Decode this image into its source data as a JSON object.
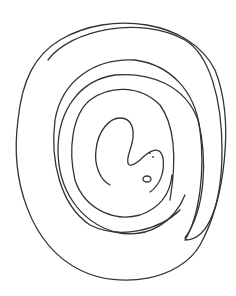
{
  "image": {
    "subject": "coiled snake spiral line drawing",
    "background": "#ffffff",
    "stroke_color": "#333333"
  },
  "paths": {
    "outer": "M 60 40 C 110 10, 190 20, 215 70 C 235 120, 225 200, 200 245 C 180 280, 120 290, 80 270 C 30 245, 10 180, 18 120 C 22 80, 35 55, 60 40 Z",
    "outer_inner": "M 48 60 C 70 30, 140 15, 185 40 C 210 55, 222 100, 222 150 C 222 200, 210 240, 185 240 C 200 215, 205 170, 200 130 C 195 90, 170 65, 135 60 C 95 58, 62 80, 55 120 C 50 160, 60 205, 90 225 C 120 240, 160 230, 180 210",
    "middle": "M 185 238 C 205 210, 208 160, 198 120 C 185 85, 150 72, 115 75 C 80 80, 58 110, 58 150 C 58 190, 80 222, 115 232 C 150 240, 175 220, 185 195",
    "inner": "M 170 200 C 175 170, 178 130, 160 105 C 140 85, 110 85, 90 100 C 72 115, 68 150, 75 180 C 85 210, 115 222, 140 215 C 160 208, 170 195, 172 175",
    "head": "M 110 185 C 100 180, 94 165, 96 150 C 98 130, 110 118, 120 118 C 132 118, 137 130, 130 150 C 125 165, 128 170, 140 160 C 150 150, 160 145, 163 158 C 165 172, 160 185, 150 192"
  }
}
